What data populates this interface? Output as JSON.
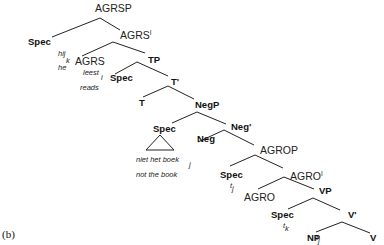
{
  "figure_label": "(b)",
  "tree": {
    "agrsp": {
      "label": "AGRSP"
    },
    "spec_subject": {
      "label": "Spec",
      "word": "hij",
      "index": "k",
      "gloss": "he"
    },
    "agrs_bar": {
      "label": "AGRS",
      "prime": "I"
    },
    "agrs": {
      "label": "AGRS",
      "word": "leest",
      "index": "i",
      "gloss": "reads"
    },
    "tp": {
      "label": "TP"
    },
    "spec_tp": {
      "label": "Spec"
    },
    "t_bar": {
      "label": "T'"
    },
    "t": {
      "label": "T"
    },
    "negp": {
      "label": "NegP"
    },
    "spec_neg": {
      "label": "Spec",
      "word": "niet het boek",
      "index": "j",
      "gloss": "not the book"
    },
    "neg_bar": {
      "label": "Neg'"
    },
    "neg": {
      "label": "Neg"
    },
    "agrop": {
      "label": "AGROP"
    },
    "spec_agro": {
      "label": "Spec",
      "trace": "t",
      "index": "j"
    },
    "agro_bar": {
      "label": "AGRO",
      "prime": "I"
    },
    "agro": {
      "label": "AGRO"
    },
    "vp": {
      "label": "VP"
    },
    "spec_vp": {
      "label": "Spec",
      "trace": "t",
      "index": "k"
    },
    "v_bar": {
      "label": "V'"
    },
    "np": {
      "label": "NP",
      "trace": "t",
      "index": "j"
    },
    "v": {
      "label": "V",
      "trace": "t",
      "index": "i"
    }
  }
}
